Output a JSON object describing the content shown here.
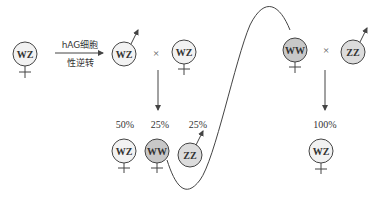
{
  "colors": {
    "light": "#f2f2f2",
    "dark": "#c8c8c8",
    "stroke": "#444444"
  },
  "arrow": {
    "top_label": "hAG细胞",
    "bottom_label": "性逆转"
  },
  "cross_symbol": "×",
  "parents_left": [
    {
      "genotype": "WZ",
      "sex": "female",
      "fill": "light"
    },
    {
      "genotype": "WZ",
      "sex": "male",
      "fill": "light"
    },
    {
      "genotype": "WZ",
      "sex": "female",
      "fill": "light"
    }
  ],
  "parents_right": [
    {
      "genotype": "WW",
      "sex": "female",
      "fill": "dark"
    },
    {
      "genotype": "ZZ",
      "sex": "male",
      "fill": "dark"
    }
  ],
  "offspring_left": [
    {
      "genotype": "WZ",
      "sex": "female",
      "percent": "50%"
    },
    {
      "genotype": "WW",
      "sex": "female",
      "percent": "25%"
    },
    {
      "genotype": "ZZ",
      "sex": "male",
      "percent": "25%"
    }
  ],
  "offspring_right": [
    {
      "genotype": "WZ",
      "sex": "female",
      "percent": "100%"
    }
  ]
}
